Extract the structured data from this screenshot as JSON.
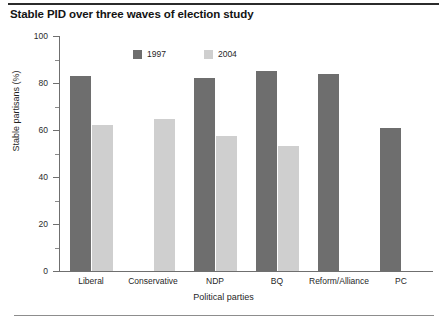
{
  "figure": {
    "title": "Stable PID over three waves of election study"
  },
  "chart_data": {
    "type": "bar",
    "title": "Stable PID over three waves of election study",
    "xlabel": "Political parties",
    "ylabel": "Stable partisans (%)",
    "ylim": [
      0,
      100
    ],
    "yticks": [
      0,
      20,
      40,
      60,
      80,
      100
    ],
    "ytick_labels": [
      "0",
      "20",
      "40",
      "60",
      "80",
      "100"
    ],
    "minor_yticks": [
      10,
      30,
      50,
      70,
      90
    ],
    "grid": false,
    "legend_position": "top-center-inside",
    "categories": [
      "Liberal",
      "Conservative",
      "NDP",
      "BQ",
      "Reform/Alliance",
      "PC"
    ],
    "series": [
      {
        "name": "1997",
        "color": "#6e6e6e",
        "values": [
          83,
          null,
          82,
          85,
          84,
          61
        ]
      },
      {
        "name": "2004",
        "color": "#cfcfcf",
        "values": [
          62,
          64.5,
          57.5,
          53,
          null,
          null
        ]
      }
    ]
  }
}
